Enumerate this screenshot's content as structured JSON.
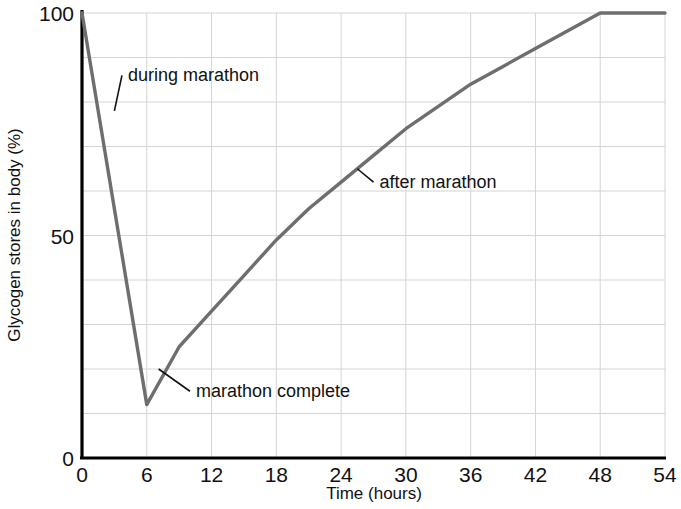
{
  "chart_data": {
    "type": "line",
    "title": "",
    "xlabel": "Time (hours)",
    "ylabel": "Glycogen stores in body (%)",
    "xlim": [
      0,
      54
    ],
    "ylim": [
      0,
      100
    ],
    "xticks": [
      0,
      6,
      12,
      18,
      24,
      30,
      36,
      42,
      48,
      54
    ],
    "yticks": [
      0,
      50,
      100
    ],
    "xtick_labels": [
      "0",
      "6",
      "12",
      "18",
      "24",
      "30",
      "36",
      "42",
      "48",
      "54"
    ],
    "ytick_labels": [
      "0",
      "50",
      "100"
    ],
    "grid": true,
    "grid_x_step": 6,
    "grid_y_step": 10,
    "legend": "none",
    "series": [
      {
        "name": "Glycogen stores",
        "color": "#6e6e6e",
        "x": [
          0,
          6,
          9,
          12,
          15,
          18,
          21,
          24,
          27,
          30,
          33,
          36,
          39,
          42,
          45,
          48,
          51,
          54
        ],
        "values": [
          100,
          12,
          25,
          33,
          41,
          49,
          56,
          62,
          68,
          74,
          79,
          84,
          88,
          92,
          96,
          100,
          100,
          100
        ]
      }
    ],
    "annotations": [
      {
        "text": "during marathon",
        "point_x": 3.0,
        "point_y": 78,
        "label_x": 3.7,
        "label_y": 86
      },
      {
        "text": "marathon complete",
        "point_x": 7.1,
        "point_y": 20,
        "label_x": 10.0,
        "label_y": 15
      },
      {
        "text": "after marathon",
        "point_x": 25.5,
        "point_y": 65,
        "label_x": 27.0,
        "label_y": 62
      }
    ]
  },
  "colors": {
    "curve": "#6e6e6e",
    "grid": "#d4d4d4",
    "axis": "#000000",
    "text": "#111111",
    "background": "#ffffff"
  }
}
